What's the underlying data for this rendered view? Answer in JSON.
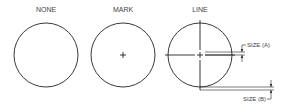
{
  "diagram": {
    "stroke_color": "#222222",
    "panels": [
      {
        "label": "NONE",
        "style": "none"
      },
      {
        "label": "MARK",
        "style": "mark"
      },
      {
        "label": "LINE",
        "style": "line"
      }
    ],
    "dimensions": {
      "size_a_label": "SIZE (A)",
      "size_b_label": "SIZE (B)"
    }
  }
}
